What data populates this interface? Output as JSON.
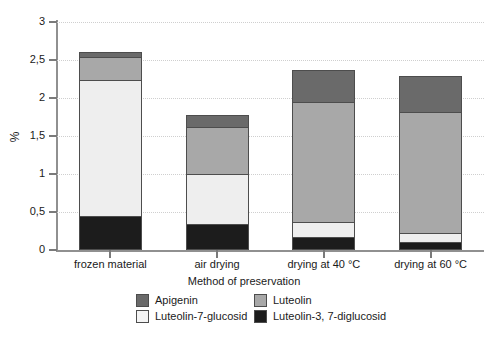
{
  "chart_data": {
    "type": "bar",
    "stacked": true,
    "title": "",
    "xlabel": "Method of preservation",
    "ylabel": "%",
    "ylim": [
      0,
      3
    ],
    "ytick_labels": [
      "0",
      "0,5",
      "1",
      "1,5",
      "2",
      "2,5",
      "3"
    ],
    "ytick_values": [
      0,
      0.5,
      1,
      1.5,
      2,
      2.5,
      3
    ],
    "grid": true,
    "grid_axis": "y",
    "legend_position": "bottom",
    "categories": [
      "frozen material",
      "air drying",
      "drying at 40 °C",
      "drying at 60 °C"
    ],
    "series": [
      {
        "name": "Luteolin-3, 7-diglucosid",
        "color": "#1c1c1c",
        "values": [
          0.45,
          0.34,
          0.17,
          0.11
        ]
      },
      {
        "name": "Luteolin-7-glucosid",
        "color": "#eeeeee",
        "values": [
          1.8,
          0.67,
          0.21,
          0.13
        ]
      },
      {
        "name": "Luteolin",
        "color": "#a8a8a8",
        "values": [
          0.31,
          0.64,
          1.59,
          1.6
        ]
      },
      {
        "name": "Apigenin",
        "color": "#6a6a6a",
        "values": [
          0.09,
          0.17,
          0.44,
          0.49
        ]
      }
    ],
    "totals": [
      2.65,
      1.82,
      2.41,
      2.33
    ]
  },
  "legend": {
    "entries": [
      {
        "label": "Apigenin",
        "color": "#6a6a6a"
      },
      {
        "label": "Luteolin",
        "color": "#a8a8a8"
      },
      {
        "label": "Luteolin-7-glucosid",
        "color": "#f4f4f4"
      },
      {
        "label": "Luteolin-3, 7-diglucosid",
        "color": "#1c1c1c"
      }
    ]
  },
  "axes": {
    "y_title": "%",
    "x_title": "Method of preservation"
  },
  "colors": {
    "apigenin": "#6a6a6a",
    "luteolin": "#a8a8a8",
    "luteolin_7_glucosid": "#f4f4f4",
    "luteolin_3_7_diglucosid": "#1c1c1c",
    "axis": "#909090",
    "grid": "#cfcfcf",
    "text": "#1a1a1a"
  }
}
